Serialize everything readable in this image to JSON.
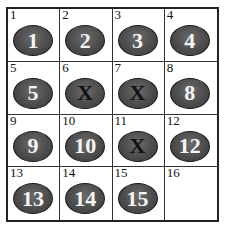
{
  "puzzle": {
    "cells": [
      {
        "index": "1",
        "token": "1",
        "blocked": false
      },
      {
        "index": "2",
        "token": "2",
        "blocked": false
      },
      {
        "index": "3",
        "token": "3",
        "blocked": false
      },
      {
        "index": "4",
        "token": "4",
        "blocked": false
      },
      {
        "index": "5",
        "token": "5",
        "blocked": false
      },
      {
        "index": "6",
        "token": "X",
        "blocked": true
      },
      {
        "index": "7",
        "token": "X",
        "blocked": true
      },
      {
        "index": "8",
        "token": "8",
        "blocked": false
      },
      {
        "index": "9",
        "token": "9",
        "blocked": false
      },
      {
        "index": "10",
        "token": "10",
        "blocked": false
      },
      {
        "index": "11",
        "token": "X",
        "blocked": true
      },
      {
        "index": "12",
        "token": "12",
        "blocked": false
      },
      {
        "index": "13",
        "token": "13",
        "blocked": false
      },
      {
        "index": "14",
        "token": "14",
        "blocked": false
      },
      {
        "index": "15",
        "token": "15",
        "blocked": false
      },
      {
        "index": "16",
        "token": null,
        "blocked": false
      }
    ],
    "colors": {
      "token_fill": "#4a4a4a",
      "token_text": "#f4f4f4",
      "blocked_text": "#111111",
      "grid_line": "#222222"
    }
  }
}
